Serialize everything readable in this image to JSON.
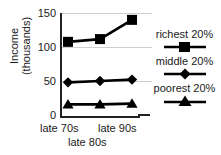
{
  "chart_data": {
    "type": "line",
    "title": "",
    "xlabel": "",
    "ylabel": "Income (thousands)",
    "ylabel_line1": "Income",
    "ylabel_line2": "(thousands)",
    "categories": [
      "late 70s",
      "late 80s",
      "late 90s"
    ],
    "ylim": [
      0,
      150
    ],
    "yticks": [
      0,
      50,
      100,
      150
    ],
    "ytick_labels": [
      "0",
      "50",
      "100",
      "150"
    ],
    "grid": true,
    "legend_position": "right",
    "series": [
      {
        "name": "richest 20%",
        "marker": "square",
        "color": "#000000",
        "values": [
          108,
          112,
          140
        ]
      },
      {
        "name": "middle 20%",
        "marker": "diamond",
        "color": "#000000",
        "values": [
          49,
          51,
          53
        ]
      },
      {
        "name": "poorest 20%",
        "marker": "triangle",
        "color": "#000000",
        "values": [
          17,
          17,
          18
        ]
      }
    ]
  },
  "axis": {
    "ytick_0": "0",
    "ytick_1": "50",
    "ytick_2": "100",
    "ytick_3": "150",
    "xtick_0": "late 70s",
    "xtick_1": "late 80s",
    "xtick_2": "late 90s"
  },
  "legend": {
    "items": [
      {
        "label": "richest 20%",
        "marker": "square-marker"
      },
      {
        "label": "middle 20%",
        "marker": "diamond-marker"
      },
      {
        "label": "poorest 20%",
        "marker": "triangle-marker"
      }
    ]
  }
}
